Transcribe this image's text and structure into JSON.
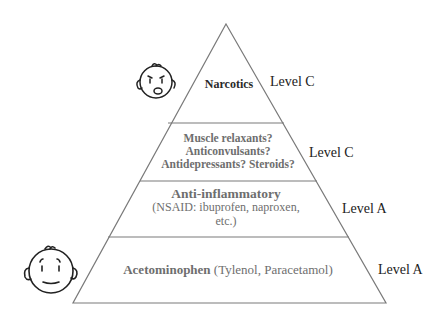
{
  "layers": [
    {
      "name": "Narcotics",
      "lines": [
        "Narcotics"
      ],
      "level": "Level C"
    },
    {
      "name": "Adjuvants",
      "lines": [
        "Muscle relaxants?",
        "Anticonvulsants?",
        "Antidepressants? Steroids?"
      ],
      "level": "Level C"
    },
    {
      "name": "Anti-inflammatory",
      "heading": "Anti-inflammatory",
      "sub_lines": [
        "(NSAID: ibuprofen, naproxen,",
        "etc.)"
      ],
      "level": "Level A"
    },
    {
      "name": "Acetominophen",
      "heading": "Acetominophen",
      "sub": "(Tylenol, Paracetamol)",
      "level": "Level A"
    }
  ],
  "icons": {
    "top_face": "worried-face-icon",
    "bottom_face": "calm-face-icon"
  },
  "colors": {
    "outline": "#7a7a7a",
    "inner_text": "#6e6e6e",
    "label_text": "#222222"
  }
}
